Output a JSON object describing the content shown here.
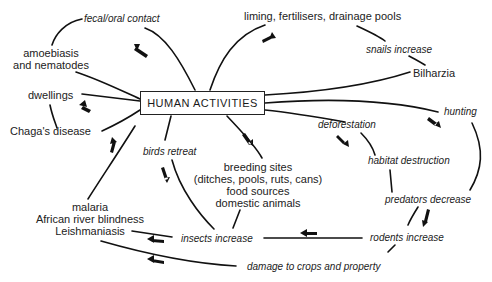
{
  "diagram": {
    "center": "HUMAN ACTIVITIES",
    "nodes": {
      "fecal_oral": "fecal/oral contact",
      "amoebiasis_1": "amoebiasis",
      "amoebiasis_2": "and nematodes",
      "dwellings": "dwellings",
      "chagas": "Chaga's disease",
      "liming": "liming, fertilisers, drainage pools",
      "snails": "snails increase",
      "bilharzia": "Bilharzia",
      "hunting": "hunting",
      "deforestation": "deforestation",
      "habitat": "habitat destruction",
      "predators": "predators decrease",
      "rodents": "rodents increase",
      "birds": "birds retreat",
      "breeding_1": "breeding sites",
      "breeding_2": "(ditches, pools, ruts, cans)",
      "breeding_3": "food sources",
      "breeding_4": "domestic animals",
      "insects": "insects increase",
      "damage": "damage to crops and property",
      "malaria_1": "malaria",
      "malaria_2": "African river blindness",
      "malaria_3": "Leishmaniasis"
    },
    "colors": {
      "line": "#111111",
      "text": "#222222",
      "background": "#ffffff"
    }
  }
}
